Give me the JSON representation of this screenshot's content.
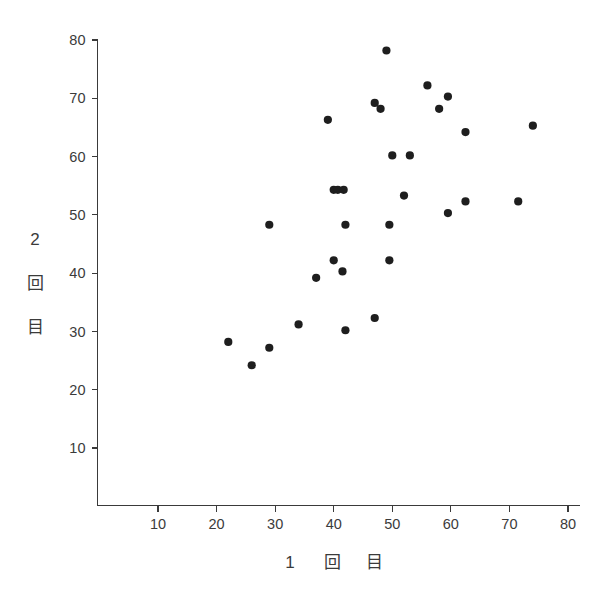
{
  "chart_data": {
    "type": "scatter",
    "title": "",
    "xlabel": "1 回 目",
    "ylabel": "2 回 目",
    "xlabel_chars": [
      "1",
      "回",
      "目"
    ],
    "ylabel_chars": [
      "2",
      "回",
      "目"
    ],
    "xlim": [
      0,
      80
    ],
    "ylim": [
      0,
      80
    ],
    "xticks": [
      10,
      20,
      30,
      40,
      50,
      60,
      70,
      80
    ],
    "yticks": [
      10,
      20,
      30,
      40,
      50,
      60,
      70,
      80
    ],
    "xtick_labels": [
      "10",
      "20",
      "30",
      "40",
      "50",
      "60",
      "70",
      "80"
    ],
    "ytick_labels": [
      "10",
      "20",
      "30",
      "40",
      "50",
      "60",
      "70",
      "80"
    ],
    "grid": false,
    "legend": null,
    "marker": "filled-circle",
    "marker_color": "#1e1e1e",
    "marker_size": 5,
    "n_points": 31,
    "points": [
      {
        "x": 22.0,
        "y": 28.2
      },
      {
        "x": 26.0,
        "y": 24.2
      },
      {
        "x": 29.0,
        "y": 27.2
      },
      {
        "x": 29.0,
        "y": 48.3
      },
      {
        "x": 34.0,
        "y": 31.2
      },
      {
        "x": 37.0,
        "y": 39.2
      },
      {
        "x": 39.0,
        "y": 66.3
      },
      {
        "x": 40.0,
        "y": 42.2
      },
      {
        "x": 40.0,
        "y": 54.3
      },
      {
        "x": 40.7,
        "y": 54.3
      },
      {
        "x": 41.7,
        "y": 54.3
      },
      {
        "x": 41.5,
        "y": 40.3
      },
      {
        "x": 42.0,
        "y": 30.2
      },
      {
        "x": 42.0,
        "y": 48.3
      },
      {
        "x": 47.0,
        "y": 32.3
      },
      {
        "x": 47.0,
        "y": 69.2
      },
      {
        "x": 48.0,
        "y": 68.2
      },
      {
        "x": 49.0,
        "y": 78.2
      },
      {
        "x": 49.5,
        "y": 42.2
      },
      {
        "x": 49.5,
        "y": 48.3
      },
      {
        "x": 50.0,
        "y": 60.2
      },
      {
        "x": 52.0,
        "y": 53.3
      },
      {
        "x": 53.0,
        "y": 60.2
      },
      {
        "x": 56.0,
        "y": 72.2
      },
      {
        "x": 58.0,
        "y": 68.2
      },
      {
        "x": 59.5,
        "y": 70.3
      },
      {
        "x": 59.5,
        "y": 50.3
      },
      {
        "x": 62.5,
        "y": 52.3
      },
      {
        "x": 62.5,
        "y": 64.2
      },
      {
        "x": 71.5,
        "y": 52.3
      },
      {
        "x": 74.0,
        "y": 65.3
      }
    ]
  },
  "colors": {
    "background": "#ffffff",
    "axis": "#3a3a3a",
    "text": "#3b3b3b",
    "marker": "#1e1e1e"
  }
}
